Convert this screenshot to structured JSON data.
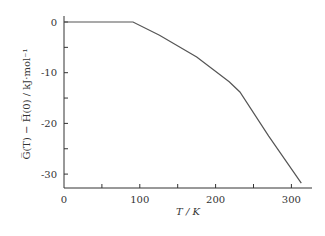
{
  "chart_data": {
    "type": "line",
    "title": "",
    "xlabel": "T / K",
    "ylabel": "G̅(T) − H̅(0) / kJ·mol⁻¹",
    "xlim": [
      0,
      320
    ],
    "ylim": [
      -33,
      1
    ],
    "x_ticks": [
      0,
      100,
      200,
      300
    ],
    "x_minor_ticks": [
      50,
      150,
      250
    ],
    "y_ticks": [
      0,
      -10,
      -20,
      -30
    ],
    "y_minor_ticks": [
      -5,
      -15,
      -25
    ],
    "grid": false,
    "legend": null,
    "series": [
      {
        "name": "G(T) - H(0)",
        "x": [
          0,
          91,
          126,
          175,
          218,
          232,
          270,
          313
        ],
        "y": [
          0,
          0,
          -2.6,
          -6.9,
          -11.8,
          -13.8,
          -22.5,
          -31.8
        ]
      }
    ]
  },
  "axes": {
    "x_tick_labels": [
      "0",
      "100",
      "200",
      "300"
    ],
    "y_tick_labels": [
      "0",
      "-10",
      "-20",
      "-30"
    ],
    "x_title": "T / K",
    "y_title": "G̅(T) − H̅(0) / kJ·mol⁻¹"
  }
}
